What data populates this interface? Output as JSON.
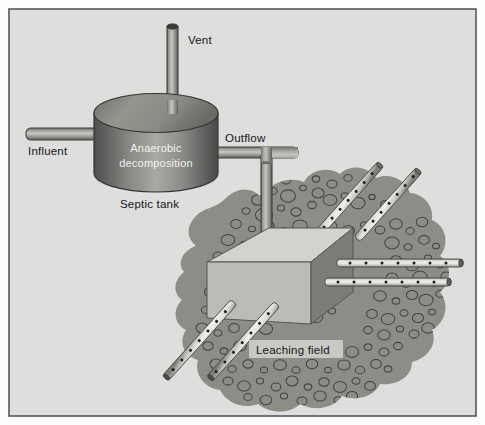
{
  "figure": {
    "frame": {
      "outer_bg": "#fdfdfd",
      "panel_bg": "#dededc",
      "border_color": "#4a4a4a"
    }
  },
  "labels": {
    "vent": "Vent",
    "influent": "Influent",
    "anaerobic_line1": "Anaerobic",
    "anaerobic_line2": "decomposition",
    "outflow": "Outflow",
    "septic_tank": "Septic tank",
    "leaching_field": "Leaching field"
  },
  "colors": {
    "panel": "#dededc",
    "tank_dark": "#5d5d5c",
    "tank_mid": "#8e8e8a",
    "tank_light": "#b5b5b0",
    "tank_top": "#9a9a96",
    "pipe_light": "#c9c9c4",
    "pipe_mid": "#a3a39e",
    "pipe_dark": "#6e6e6a",
    "gravel_fill": "#8d8d88",
    "gravel_stroke": "#43433f",
    "box_top": "#d3d3ce",
    "box_front": "#bcbcb7",
    "box_side": "#7c7c77",
    "perf_pipe_fill": "#e2e2dd",
    "perf_hole": "#1e1e1c",
    "label_box": "#c9c9c4",
    "text_dark": "#15161a",
    "text_light": "#f2f2f0"
  },
  "elements": {
    "vent_pipe": "vertical cylindrical vent pipe rising from septic tank lid",
    "influent_pipe": "horizontal inlet pipe entering tank from left",
    "septic_tank": "cylindrical tank with elliptical top",
    "outflow_pipe": "elbow pipe leaving tank right side then descending",
    "distribution_box": "isometric rectangular distribution box",
    "gravel_bed": "irregular gravel blob with pebble circles",
    "perforated_pipes_count": 6
  },
  "gravel_pebbles": [
    [
      258,
      200,
      6.5
    ],
    [
      273,
      191,
      4.2
    ],
    [
      288,
      196,
      7.5
    ],
    [
      303,
      188,
      3.4
    ],
    [
      318,
      193,
      6.0
    ],
    [
      246,
      211,
      4.0
    ],
    [
      264,
      215,
      8.5
    ],
    [
      281,
      208,
      3.6
    ],
    [
      296,
      212,
      5.2
    ],
    [
      312,
      205,
      4.4
    ],
    [
      330,
      200,
      6.8
    ],
    [
      345,
      196,
      4.0
    ],
    [
      358,
      203,
      7.0
    ],
    [
      372,
      197,
      3.2
    ],
    [
      386,
      205,
      5.6
    ],
    [
      236,
      224,
      5.4
    ],
    [
      252,
      229,
      3.4
    ],
    [
      268,
      226,
      6.2
    ],
    [
      284,
      231,
      4.2
    ],
    [
      300,
      226,
      7.4
    ],
    [
      316,
      232,
      3.8
    ],
    [
      332,
      226,
      5.0
    ],
    [
      348,
      231,
      6.6
    ],
    [
      364,
      225,
      3.6
    ],
    [
      380,
      230,
      4.8
    ],
    [
      396,
      224,
      6.4
    ],
    [
      410,
      231,
      4.2
    ],
    [
      422,
      222,
      5.8
    ],
    [
      228,
      240,
      6.8
    ],
    [
      244,
      245,
      4.4
    ],
    [
      262,
      242,
      3.2
    ],
    [
      392,
      243,
      7.2
    ],
    [
      408,
      247,
      4.0
    ],
    [
      424,
      240,
      5.4
    ],
    [
      436,
      246,
      3.4
    ],
    [
      218,
      256,
      5.0
    ],
    [
      232,
      262,
      6.8
    ],
    [
      248,
      257,
      3.8
    ],
    [
      396,
      260,
      5.2
    ],
    [
      412,
      265,
      7.0
    ],
    [
      428,
      258,
      3.6
    ],
    [
      440,
      264,
      4.8
    ],
    [
      214,
      274,
      4.2
    ],
    [
      228,
      280,
      6.2
    ],
    [
      243,
      275,
      3.4
    ],
    [
      392,
      278,
      6.0
    ],
    [
      406,
      284,
      4.2
    ],
    [
      420,
      277,
      7.2
    ],
    [
      434,
      283,
      3.8
    ],
    [
      446,
      276,
      5.0
    ],
    [
      210,
      292,
      5.6
    ],
    [
      225,
      297,
      3.6
    ],
    [
      240,
      292,
      6.8
    ],
    [
      256,
      298,
      4.0
    ],
    [
      272,
      293,
      3.4
    ],
    [
      288,
      299,
      5.2
    ],
    [
      380,
      296,
      6.4
    ],
    [
      396,
      301,
      3.8
    ],
    [
      412,
      295,
      5.6
    ],
    [
      426,
      300,
      7.0
    ],
    [
      440,
      294,
      4.2
    ],
    [
      206,
      310,
      4.6
    ],
    [
      220,
      315,
      6.6
    ],
    [
      236,
      310,
      3.4
    ],
    [
      252,
      316,
      5.0
    ],
    [
      268,
      311,
      6.2
    ],
    [
      284,
      317,
      3.8
    ],
    [
      300,
      311,
      4.4
    ],
    [
      316,
      317,
      6.8
    ],
    [
      332,
      311,
      3.6
    ],
    [
      372,
      314,
      5.4
    ],
    [
      388,
      319,
      6.8
    ],
    [
      404,
      313,
      4.0
    ],
    [
      418,
      318,
      5.6
    ],
    [
      432,
      312,
      3.4
    ],
    [
      202,
      328,
      6.0
    ],
    [
      218,
      333,
      4.0
    ],
    [
      234,
      328,
      5.4
    ],
    [
      250,
      334,
      3.6
    ],
    [
      266,
      329,
      6.6
    ],
    [
      368,
      330,
      4.4
    ],
    [
      384,
      335,
      6.2
    ],
    [
      400,
      329,
      3.6
    ],
    [
      414,
      334,
      5.0
    ],
    [
      428,
      328,
      6.4
    ],
    [
      208,
      346,
      5.2
    ],
    [
      224,
      351,
      3.8
    ],
    [
      240,
      346,
      6.4
    ],
    [
      256,
      352,
      4.2
    ],
    [
      272,
      347,
      5.6
    ],
    [
      288,
      352,
      3.4
    ],
    [
      304,
      347,
      6.2
    ],
    [
      320,
      353,
      4.0
    ],
    [
      336,
      347,
      5.4
    ],
    [
      352,
      352,
      6.6
    ],
    [
      368,
      347,
      3.8
    ],
    [
      384,
      352,
      5.0
    ],
    [
      398,
      346,
      4.4
    ],
    [
      216,
      364,
      6.0
    ],
    [
      232,
      369,
      4.2
    ],
    [
      248,
      364,
      5.2
    ],
    [
      264,
      370,
      3.6
    ],
    [
      280,
      365,
      6.4
    ],
    [
      296,
      370,
      4.0
    ],
    [
      312,
      364,
      5.8
    ],
    [
      328,
      370,
      3.4
    ],
    [
      344,
      365,
      6.2
    ],
    [
      360,
      370,
      4.6
    ],
    [
      376,
      364,
      5.4
    ],
    [
      388,
      369,
      3.8
    ],
    [
      228,
      381,
      5.0
    ],
    [
      244,
      386,
      6.4
    ],
    [
      260,
      381,
      3.6
    ],
    [
      276,
      387,
      4.8
    ],
    [
      292,
      381,
      6.0
    ],
    [
      308,
      387,
      3.8
    ],
    [
      324,
      382,
      5.2
    ],
    [
      340,
      387,
      6.6
    ],
    [
      356,
      381,
      4.0
    ],
    [
      370,
      386,
      5.4
    ],
    [
      248,
      397,
      4.2
    ],
    [
      266,
      400,
      5.8
    ],
    [
      284,
      396,
      3.6
    ],
    [
      302,
      401,
      5.0
    ],
    [
      320,
      396,
      6.2
    ],
    [
      338,
      400,
      4.0
    ],
    [
      352,
      396,
      5.6
    ],
    [
      240,
      185,
      4.0
    ],
    [
      254,
      180,
      5.6
    ],
    [
      270,
      176,
      3.4
    ],
    [
      286,
      180,
      4.8
    ],
    [
      300,
      174,
      6.2
    ],
    [
      316,
      179,
      3.8
    ],
    [
      332,
      184,
      5.0
    ],
    [
      348,
      178,
      4.2
    ]
  ]
}
